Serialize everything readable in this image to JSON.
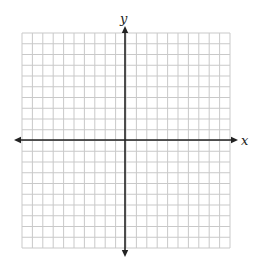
{
  "chart_data": {
    "type": "scatter",
    "title": "",
    "xlabel": "x",
    "ylabel": "y",
    "xlim": [
      -10,
      10
    ],
    "ylim": [
      -10,
      10
    ],
    "grid": true,
    "grid_divisions": {
      "x": 20,
      "y": 20
    },
    "axes_arrows": true,
    "series": [],
    "tick_labels": {
      "x": [],
      "y": []
    }
  },
  "layout": {
    "grid_left": 22,
    "grid_top": 33,
    "grid_right": 230,
    "grid_bottom": 248,
    "x_axis_y": 140,
    "y_axis_x": 125,
    "x_arrow_left": 14,
    "x_arrow_right": 238,
    "y_arrow_top": 26,
    "y_arrow_bottom": 257
  },
  "colors": {
    "grid": "#c9c9c9",
    "axis": "#222222",
    "background": "#ffffff"
  }
}
